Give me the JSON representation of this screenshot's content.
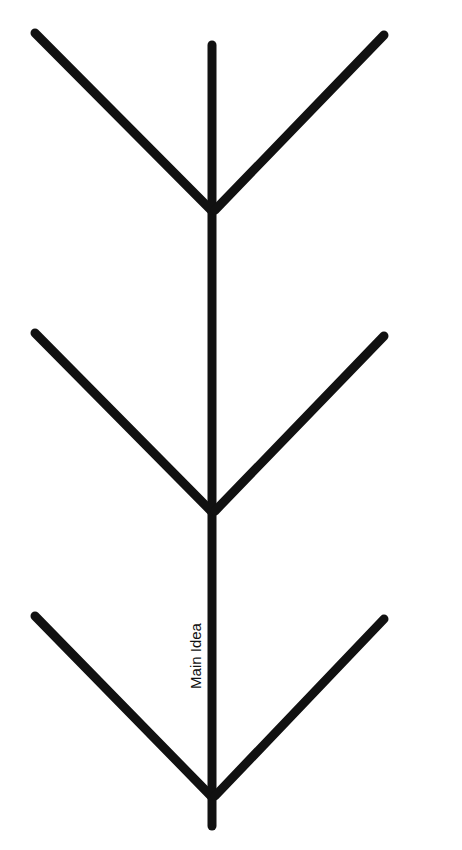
{
  "diagram": {
    "type": "fishbone",
    "spine_label": "Main Idea",
    "stroke_color": "#111111",
    "background": "#ffffff",
    "spine": {
      "x1": 212,
      "y1": 45,
      "x2": 212,
      "y2": 826
    },
    "branch_groups": [
      {
        "name": "top",
        "left": {
          "x1": 35,
          "y1": 33,
          "x2": 211,
          "y2": 210
        },
        "right": {
          "x1": 384,
          "y1": 35,
          "x2": 215,
          "y2": 210
        }
      },
      {
        "name": "middle",
        "left": {
          "x1": 35,
          "y1": 333,
          "x2": 211,
          "y2": 511
        },
        "right": {
          "x1": 384,
          "y1": 336,
          "x2": 215,
          "y2": 511
        }
      },
      {
        "name": "bottom",
        "left": {
          "x1": 35,
          "y1": 616,
          "x2": 211,
          "y2": 796
        },
        "right": {
          "x1": 384,
          "y1": 619,
          "x2": 215,
          "y2": 796
        }
      }
    ]
  }
}
